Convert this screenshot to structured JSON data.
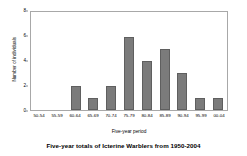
{
  "chart_data": {
    "type": "bar",
    "title": "Five-year totals of Icterine Warblers from 1950-2004",
    "xlabel": "Five-year period",
    "ylabel": "Number of individuals",
    "categories": [
      "50-54",
      "55-59",
      "60-64",
      "65-69",
      "70-74",
      "75-79",
      "80-84",
      "85-89",
      "90-94",
      "95-99",
      "00-04"
    ],
    "values": [
      0,
      0,
      2,
      1,
      2,
      6,
      4,
      5,
      3,
      1,
      1
    ],
    "ylim": [
      0,
      8
    ],
    "yticks": [
      0,
      2,
      4,
      6,
      8
    ],
    "ytick_labels": [
      "0",
      "2",
      "4",
      "6",
      "8"
    ],
    "grid": false,
    "legend": null,
    "bar_color": "#7b7b7b",
    "frame_color": "#a8a8a8",
    "background": "#ffffff"
  }
}
